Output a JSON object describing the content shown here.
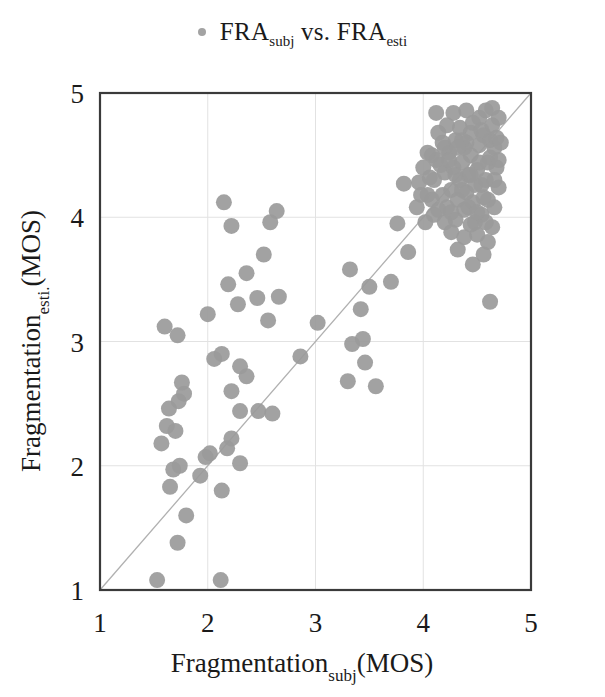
{
  "figure": {
    "legend": {
      "marker": "scatter-dot-marker",
      "marker_color": "#a3a3a3",
      "text_main_1": "FRA",
      "text_sub_1": "subj",
      "text_mid": " vs. ",
      "text_main_2": "FRA",
      "text_sub_2": "esti"
    },
    "axes": {
      "x_title_main": "Fragmentation",
      "x_title_sub": "subj",
      "x_title_tail": "(MOS)",
      "y_title_main": "Fragmentation",
      "y_title_sub": "esti.",
      "y_title_tail": "(MOS)",
      "x_ticks": [
        "1",
        "2",
        "3",
        "4",
        "5"
      ],
      "y_ticks": [
        "1",
        "2",
        "3",
        "4",
        "5"
      ]
    },
    "colors": {
      "point": "#9a9a9a",
      "grid": "#e2e2e2",
      "frame": "#3a3a3a",
      "identity_line": "#b0b0b0"
    }
  },
  "chart_data": {
    "type": "scatter",
    "xlabel": "Fragmentation_subj(MOS)",
    "ylabel": "Fragmentation_esti.(MOS)",
    "xlim": [
      1,
      5
    ],
    "ylim": [
      1,
      5
    ],
    "xticks": [
      1,
      2,
      3,
      4,
      5
    ],
    "yticks": [
      1,
      2,
      3,
      4,
      5
    ],
    "grid": true,
    "legend_position": "top-center",
    "reference_line": {
      "name": "identity",
      "from": [
        1,
        1
      ],
      "to": [
        5,
        5
      ],
      "color": "#b0b0b0"
    },
    "series": [
      {
        "name": "FRA_subj vs. FRA_esti",
        "marker": "circle",
        "color": "#9a9a9a",
        "points": [
          [
            1.53,
            1.08
          ],
          [
            2.12,
            1.08
          ],
          [
            1.72,
            1.38
          ],
          [
            1.8,
            1.6
          ],
          [
            1.65,
            1.83
          ],
          [
            2.13,
            1.8
          ],
          [
            1.68,
            1.97
          ],
          [
            1.74,
            2.0
          ],
          [
            1.93,
            1.92
          ],
          [
            2.02,
            2.1
          ],
          [
            1.98,
            2.07
          ],
          [
            2.3,
            2.02
          ],
          [
            2.18,
            2.14
          ],
          [
            1.57,
            2.18
          ],
          [
            2.22,
            2.22
          ],
          [
            1.62,
            2.32
          ],
          [
            1.7,
            2.28
          ],
          [
            2.3,
            2.44
          ],
          [
            2.47,
            2.44
          ],
          [
            1.64,
            2.46
          ],
          [
            2.6,
            2.42
          ],
          [
            1.73,
            2.52
          ],
          [
            1.78,
            2.58
          ],
          [
            1.76,
            2.67
          ],
          [
            2.22,
            2.6
          ],
          [
            2.36,
            2.72
          ],
          [
            2.3,
            2.8
          ],
          [
            2.06,
            2.86
          ],
          [
            2.13,
            2.9
          ],
          [
            1.6,
            3.12
          ],
          [
            1.72,
            3.05
          ],
          [
            2.0,
            3.22
          ],
          [
            2.56,
            3.17
          ],
          [
            2.28,
            3.3
          ],
          [
            2.46,
            3.35
          ],
          [
            2.66,
            3.36
          ],
          [
            2.19,
            3.46
          ],
          [
            2.36,
            3.55
          ],
          [
            2.52,
            3.7
          ],
          [
            2.22,
            3.93
          ],
          [
            2.15,
            4.12
          ],
          [
            2.58,
            3.96
          ],
          [
            2.64,
            4.05
          ],
          [
            2.86,
            2.88
          ],
          [
            3.02,
            3.15
          ],
          [
            3.3,
            2.68
          ],
          [
            3.34,
            2.98
          ],
          [
            3.44,
            3.02
          ],
          [
            3.42,
            3.26
          ],
          [
            3.32,
            3.58
          ],
          [
            3.5,
            3.44
          ],
          [
            3.56,
            2.64
          ],
          [
            3.46,
            2.83
          ],
          [
            3.76,
            3.95
          ],
          [
            3.82,
            4.27
          ],
          [
            3.7,
            3.48
          ],
          [
            3.86,
            3.72
          ],
          [
            3.94,
            4.08
          ],
          [
            4.02,
            3.96
          ],
          [
            4.04,
            4.18
          ],
          [
            4.1,
            4.02
          ],
          [
            4.06,
            4.32
          ],
          [
            4.12,
            4.46
          ],
          [
            4.18,
            4.18
          ],
          [
            4.2,
            4.36
          ],
          [
            4.22,
            4.08
          ],
          [
            4.26,
            4.22
          ],
          [
            4.28,
            4.4
          ],
          [
            4.24,
            4.52
          ],
          [
            4.3,
            3.98
          ],
          [
            4.32,
            4.14
          ],
          [
            4.34,
            4.3
          ],
          [
            4.36,
            4.44
          ],
          [
            4.38,
            4.06
          ],
          [
            4.4,
            4.2
          ],
          [
            4.42,
            4.34
          ],
          [
            4.44,
            4.5
          ],
          [
            4.46,
            4.12
          ],
          [
            4.48,
            4.26
          ],
          [
            4.5,
            4.38
          ],
          [
            4.52,
            4.58
          ],
          [
            4.54,
            4.02
          ],
          [
            4.56,
            4.16
          ],
          [
            4.58,
            4.3
          ],
          [
            4.6,
            4.44
          ],
          [
            4.62,
            4.62
          ],
          [
            4.64,
            4.74
          ],
          [
            4.52,
            4.8
          ],
          [
            4.58,
            4.86
          ],
          [
            4.44,
            4.68
          ],
          [
            4.38,
            4.56
          ],
          [
            4.3,
            4.62
          ],
          [
            4.2,
            4.56
          ],
          [
            4.14,
            4.68
          ],
          [
            4.08,
            4.5
          ],
          [
            4.0,
            4.4
          ],
          [
            3.96,
            4.28
          ],
          [
            4.66,
            4.56
          ],
          [
            4.68,
            4.4
          ],
          [
            4.7,
            4.24
          ],
          [
            4.66,
            4.08
          ],
          [
            4.64,
            3.92
          ],
          [
            4.6,
            3.8
          ],
          [
            4.56,
            3.7
          ],
          [
            4.5,
            3.86
          ],
          [
            4.44,
            3.94
          ],
          [
            4.38,
            3.84
          ],
          [
            4.32,
            3.74
          ],
          [
            4.26,
            3.88
          ],
          [
            4.2,
            3.96
          ],
          [
            4.14,
            4.06
          ],
          [
            4.08,
            4.14
          ],
          [
            4.62,
            3.32
          ],
          [
            4.46,
            3.62
          ],
          [
            4.52,
            4.44
          ],
          [
            4.4,
            4.6
          ],
          [
            4.34,
            4.72
          ],
          [
            4.28,
            4.84
          ],
          [
            4.56,
            4.66
          ],
          [
            4.62,
            4.48
          ],
          [
            4.68,
            4.64
          ],
          [
            4.16,
            4.42
          ],
          [
            4.1,
            4.3
          ],
          [
            4.04,
            4.52
          ],
          [
            3.98,
            4.18
          ],
          [
            4.48,
            3.96
          ],
          [
            4.42,
            4.08
          ],
          [
            4.36,
            4.22
          ],
          [
            4.3,
            4.34
          ],
          [
            4.24,
            4.46
          ],
          [
            4.18,
            4.6
          ],
          [
            4.54,
            4.26
          ],
          [
            4.6,
            4.14
          ],
          [
            4.66,
            4.3
          ],
          [
            4.7,
            4.46
          ],
          [
            4.72,
            4.6
          ],
          [
            4.58,
            3.96
          ],
          [
            4.5,
            4.04
          ],
          [
            4.12,
            4.84
          ],
          [
            4.22,
            4.74
          ],
          [
            4.7,
            4.8
          ],
          [
            4.64,
            4.88
          ],
          [
            4.36,
            4.62
          ],
          [
            4.44,
            4.34
          ],
          [
            4.26,
            4.04
          ],
          [
            4.32,
            4.56
          ],
          [
            4.46,
            4.76
          ],
          [
            4.54,
            4.7
          ],
          [
            4.4,
            4.86
          ]
        ]
      }
    ]
  }
}
